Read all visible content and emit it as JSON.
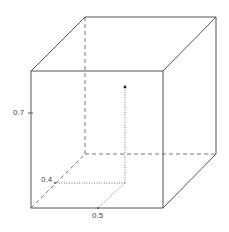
{
  "diagram": {
    "type": "3d-unit-cube-point",
    "point": {
      "x": 0.5,
      "y": 0.4,
      "z": 0.7
    },
    "labels": {
      "z_tick": "0.7",
      "y_tick": "0.4",
      "x_tick": "0.5"
    },
    "colors": {
      "edges": "#555555",
      "hidden_edges": "#666666",
      "projection": "#666666",
      "point": "#222222"
    }
  }
}
